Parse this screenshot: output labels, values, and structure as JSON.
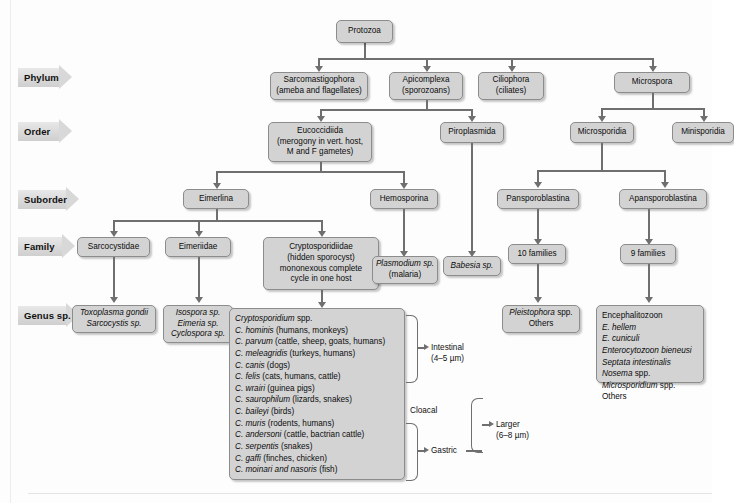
{
  "diagram": {
    "ranks": [
      {
        "key": "phylum",
        "label": "Phylum"
      },
      {
        "key": "order",
        "label": "Order"
      },
      {
        "key": "suborder",
        "label": "Suborder"
      },
      {
        "key": "family",
        "label": "Family"
      },
      {
        "key": "genus",
        "label": "Genus sp."
      }
    ],
    "root": {
      "label": "Protozoa"
    },
    "phylum": [
      {
        "l1": "Sarcomastigophora",
        "l2": "(ameba and flagellates)"
      },
      {
        "l1": "Apicomplexa",
        "l2": "(sporozoans)"
      },
      {
        "l1": "Ciliophora",
        "l2": "(ciliates)"
      },
      {
        "l1": "Microspora",
        "l2": ""
      }
    ],
    "order": [
      {
        "l1": "Eucoccidiida",
        "l2": "(merogony in vert. host,",
        "l3": "M and F gametes)"
      },
      {
        "l1": "Piroplasmida",
        "l2": ""
      },
      {
        "l1": "Microsporidia",
        "l2": ""
      },
      {
        "l1": "Minisporidia",
        "l2": ""
      }
    ],
    "suborder": [
      {
        "l1": "Eimerlina"
      },
      {
        "l1": "Hemosporina"
      },
      {
        "l1": "Pansporoblastina"
      },
      {
        "l1": "Apansporoblastina"
      }
    ],
    "family": [
      {
        "l1": "Sarcocystidae"
      },
      {
        "l1": "Eimeriidae"
      },
      {
        "l1": "Cryptosporidiidae",
        "l2": "(hidden sporocyst)",
        "l3": "mononexous complete",
        "l4": "cycle in one host"
      },
      {
        "l1": "Plasmodium sp.",
        "l2": "(malaria)"
      },
      {
        "l1": "Babesia sp."
      },
      {
        "l1": "10 families"
      },
      {
        "l1": "9 families"
      }
    ],
    "genus": {
      "sarcocystidae": [
        "Toxoplasma gondii",
        "Sarcocystis sp."
      ],
      "eimeriidae": [
        "Isospora sp.",
        "Eimeria sp.",
        "Cyclospora sp."
      ],
      "cryptosporidium": [
        {
          "italic_prefix": "Cryptosporidium",
          "rest": " spp."
        },
        {
          "italic_prefix": "C. hominis",
          "rest": " (humans, monkeys)"
        },
        {
          "italic_prefix": "C. parvum",
          "rest": " (cattle, sheep, goats, humans)"
        },
        {
          "italic_prefix": "C. meleagridis",
          "rest": " (turkeys, humans)"
        },
        {
          "italic_prefix": "C. canis",
          "rest": " (dogs)"
        },
        {
          "italic_prefix": "C. felis",
          "rest": " (cats, humans, cattle)"
        },
        {
          "italic_prefix": "C. wrairi",
          "rest": " (guinea pigs)"
        },
        {
          "italic_prefix": "C. saurophilum",
          "rest": " (lizards, snakes)"
        },
        {
          "italic_prefix": "",
          "rest": ""
        },
        {
          "italic_prefix": "C. baileyi",
          "rest": " (birds)"
        },
        {
          "italic_prefix": "",
          "rest": ""
        },
        {
          "italic_prefix": "C. muris",
          "rest": " (rodents, humans)"
        },
        {
          "italic_prefix": "C. andersoni",
          "rest": " (cattle, bactrian cattle)"
        },
        {
          "italic_prefix": "C. serpentis",
          "rest": " (snakes)"
        },
        {
          "italic_prefix": "C. gaffi",
          "rest": " (finches, chicken)"
        },
        {
          "italic_prefix": "C. moinari and nasoris",
          "rest": " (fish)"
        }
      ],
      "pleistophora": [
        {
          "italic_prefix": "Pleistophora",
          "rest": " spp."
        },
        {
          "italic_prefix": "",
          "rest": "Others"
        }
      ],
      "encephalitozoon": [
        {
          "italic_prefix": "",
          "rest": "Encephalitozoon"
        },
        {
          "italic_prefix": "E. hellem",
          "rest": ""
        },
        {
          "italic_prefix": "E. cuniculi",
          "rest": ""
        },
        {
          "italic_prefix": "Enterocytozoon bieneusi",
          "rest": ""
        },
        {
          "italic_prefix": "Septata intestinalis",
          "rest": ""
        },
        {
          "italic_prefix": "Nosema",
          "rest": " spp."
        },
        {
          "italic_prefix": "Microsporidium",
          "rest": " spp."
        },
        {
          "italic_prefix": "",
          "rest": "Others"
        }
      ]
    },
    "annotations": [
      {
        "key": "intestinal",
        "l1": "Intestinal",
        "l2": "(4–5 µm)"
      },
      {
        "key": "cloacal",
        "l1": "Cloacal",
        "l2": ""
      },
      {
        "key": "gastric",
        "l1": "Gastric",
        "l2": ""
      },
      {
        "key": "larger",
        "l1": "Larger",
        "l2": "(6–8 µm)"
      }
    ],
    "colors": {
      "box_fill": "#d3d3d3",
      "box_border": "#8c8c8c",
      "connector": "#6f6f6f",
      "rank_arrow": "#d8d8d8",
      "background": "#fdfdfd"
    }
  }
}
